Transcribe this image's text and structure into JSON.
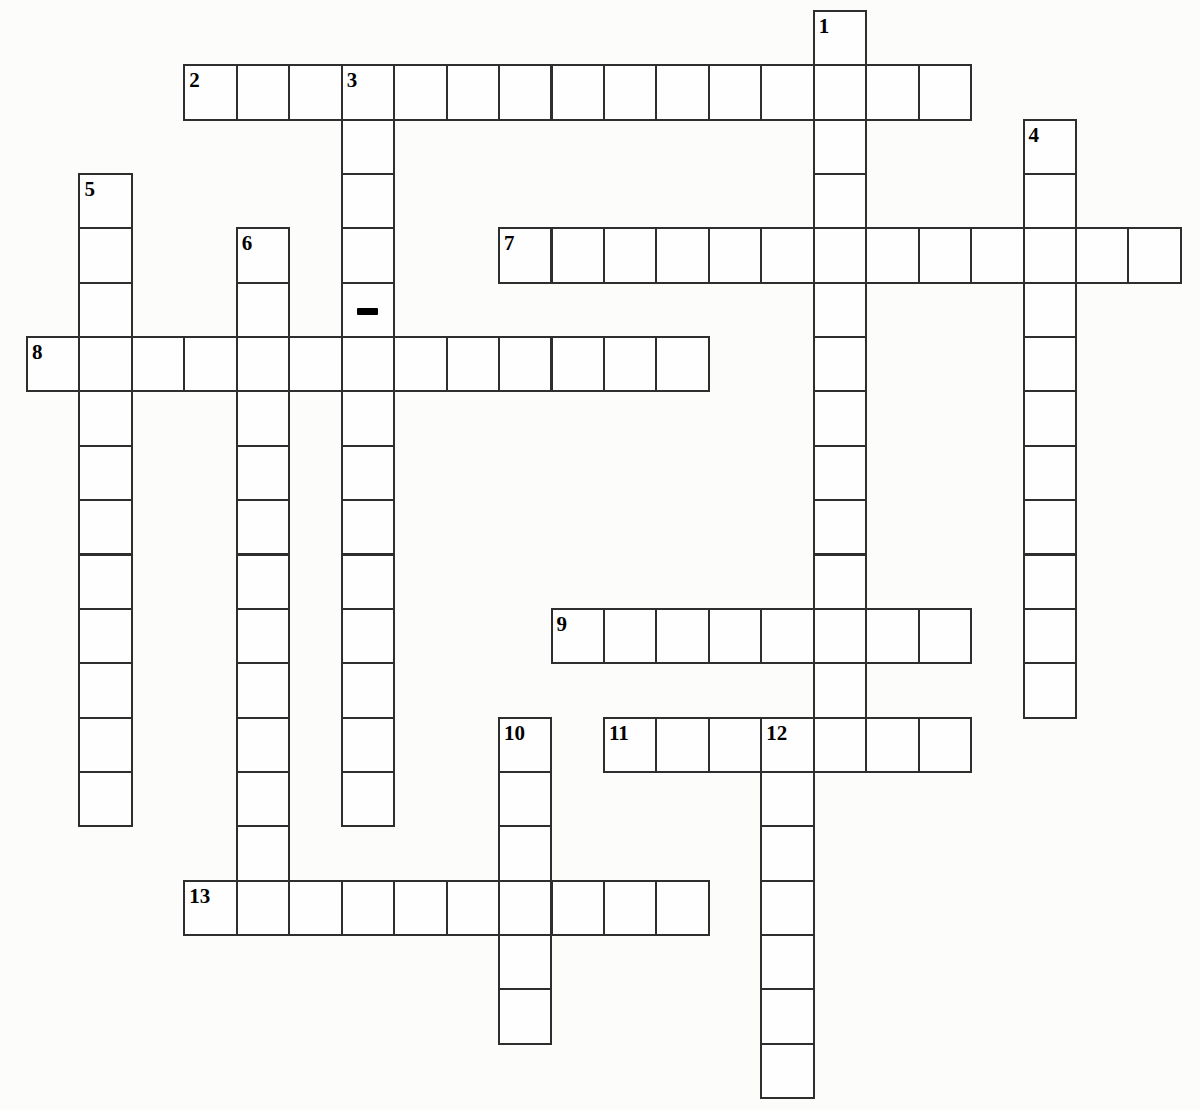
{
  "page": {
    "background_color": "#fcfcfa"
  },
  "colors": {
    "background": "#fcfcfa",
    "cell_fill": "#fefefe",
    "grid_line": "#2e2e2e",
    "number_text": "#000000"
  },
  "grid": {
    "origin_x": 26,
    "origin_y": 10,
    "cell_width": 52.45,
    "cell_height": 54.35,
    "line_thickness": 2,
    "all_cells_empty": true
  },
  "puzzle": {
    "entries": [
      {
        "number": 2,
        "direction": "across",
        "col": 3,
        "row": 1,
        "length": 15
      },
      {
        "number": 7,
        "direction": "across",
        "col": 9,
        "row": 4,
        "length": 13
      },
      {
        "number": 8,
        "direction": "across",
        "col": 0,
        "row": 6,
        "length": 13
      },
      {
        "number": 9,
        "direction": "across",
        "col": 10,
        "row": 11,
        "length": 8
      },
      {
        "number": 11,
        "direction": "across",
        "col": 11,
        "row": 13,
        "length": 7
      },
      {
        "number": 13,
        "direction": "across",
        "col": 3,
        "row": 16,
        "length": 10
      },
      {
        "number": 1,
        "direction": "down",
        "col": 15,
        "row": 0,
        "length": 14
      },
      {
        "number": 3,
        "direction": "down",
        "col": 6,
        "row": 1,
        "length": 14
      },
      {
        "number": 4,
        "direction": "down",
        "col": 19,
        "row": 2,
        "length": 11
      },
      {
        "number": 5,
        "direction": "down",
        "col": 1,
        "row": 3,
        "length": 12
      },
      {
        "number": 6,
        "direction": "down",
        "col": 4,
        "row": 4,
        "length": 13
      },
      {
        "number": 10,
        "direction": "down",
        "col": 9,
        "row": 13,
        "length": 6
      },
      {
        "number": 12,
        "direction": "down",
        "col": 14,
        "row": 13,
        "length": 7
      }
    ],
    "cell_numbers": [
      {
        "number": "1",
        "col": 15,
        "row": 0
      },
      {
        "number": "2",
        "col": 3,
        "row": 1
      },
      {
        "number": "3",
        "col": 6,
        "row": 1
      },
      {
        "number": "4",
        "col": 19,
        "row": 2
      },
      {
        "number": "5",
        "col": 1,
        "row": 3
      },
      {
        "number": "6",
        "col": 4,
        "row": 4
      },
      {
        "number": "7",
        "col": 9,
        "row": 4
      },
      {
        "number": "8",
        "col": 0,
        "row": 6
      },
      {
        "number": "9",
        "col": 10,
        "row": 11
      },
      {
        "number": "10",
        "col": 9,
        "row": 13
      },
      {
        "number": "11",
        "col": 11,
        "row": 13
      },
      {
        "number": "12",
        "col": 14,
        "row": 13
      },
      {
        "number": "13",
        "col": 3,
        "row": 16
      }
    ],
    "hyphen_marker": {
      "col": 6,
      "row": 5,
      "meaning": "hyphen in 3-down answer",
      "width": 21,
      "height": 7
    }
  }
}
